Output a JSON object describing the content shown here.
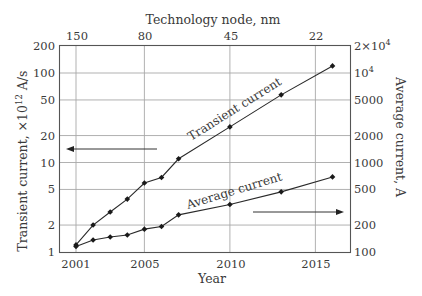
{
  "chart_data": {
    "type": "line",
    "title": "",
    "xlabel": "Year",
    "ylabel": "Transient current, ×10^12 A/s",
    "ylabel_right": "Average current, A",
    "xlabel_top": "Technology node, nm",
    "x_ticks": [
      "2001",
      "2005",
      "2010",
      "2015"
    ],
    "x_tick_values": [
      2001,
      2005,
      2010,
      2015
    ],
    "top_ticks": [
      {
        "label": "150",
        "year": 2001
      },
      {
        "label": "80",
        "year": 2005
      },
      {
        "label": "45",
        "year": 2010
      },
      {
        "label": "22",
        "year": 2015
      }
    ],
    "y_ticks_left": [
      "1",
      "2",
      "5",
      "10",
      "20",
      "50",
      "100",
      "200"
    ],
    "y_tick_values_left": [
      1,
      2,
      5,
      10,
      20,
      50,
      100,
      200
    ],
    "y_ticks_right": [
      "100",
      "200",
      "500",
      "1000",
      "2000",
      "5000",
      "10^4",
      "2×10^4"
    ],
    "y_tick_values_right": [
      100,
      200,
      500,
      1000,
      2000,
      5000,
      10000,
      20000
    ],
    "xlim": [
      2000,
      2017.1
    ],
    "ylim_left": [
      1,
      200
    ],
    "ylim_right": [
      100,
      20000
    ],
    "yscale": "log",
    "grid": true,
    "legend": "inline annotations with arrows",
    "series": [
      {
        "name": "Transient current",
        "axis": "left",
        "x": [
          2001,
          2002,
          2003,
          2004,
          2005,
          2006,
          2007,
          2010,
          2013,
          2016
        ],
        "values": [
          1.2,
          2.0,
          2.8,
          3.9,
          5.9,
          6.8,
          11,
          25,
          57,
          120
        ]
      },
      {
        "name": "Average current",
        "axis": "right",
        "x": [
          2001,
          2002,
          2003,
          2004,
          2005,
          2006,
          2007,
          2010,
          2013,
          2016
        ],
        "values": [
          115,
          136,
          147,
          155,
          180,
          193,
          260,
          340,
          470,
          690
        ]
      }
    ],
    "annotations": [
      {
        "text": "Transient current",
        "arrow": "left"
      },
      {
        "text": "Average current",
        "arrow": "right"
      }
    ]
  },
  "labels": {
    "top_title": "Technology node, nm",
    "x_title": "Year",
    "left_title": "Transient current, ×10",
    "left_title_sup": "12",
    "left_title_unit": " A/s",
    "right_title": "Average current, A",
    "transient_annot": "Transient current",
    "average_annot": "Average current",
    "top_ticks": [
      "150",
      "80",
      "45",
      "22"
    ],
    "bottom_ticks": [
      "2001",
      "2005",
      "2010",
      "2015"
    ],
    "left_ticks": [
      "200",
      "100",
      "50",
      "20",
      "10",
      "5",
      "2",
      "1"
    ],
    "right_ticks": [
      "2×10",
      "10",
      "5000",
      "2000",
      "1000",
      "500",
      "200",
      "100"
    ],
    "right_ticks_sup": [
      "4",
      "4"
    ]
  },
  "colors": {
    "line": "#2a2a2a",
    "grid": "#9a9a9a",
    "frame": "#555555",
    "text": "#3a3a3a"
  }
}
